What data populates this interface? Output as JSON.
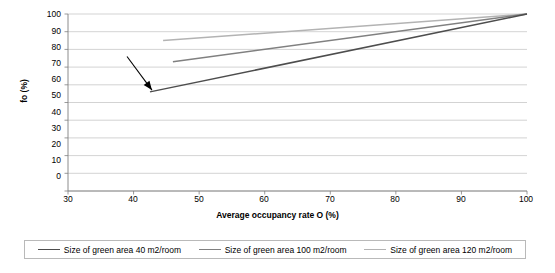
{
  "chart_data": {
    "type": "line",
    "title": "",
    "xlabel": "Average occupancy rate O (%)",
    "ylabel": "fo (%)",
    "xlim": [
      30,
      100
    ],
    "ylim": [
      0,
      100
    ],
    "xticks": [
      30,
      40,
      50,
      60,
      70,
      80,
      90,
      100
    ],
    "yticks": [
      0,
      10,
      20,
      30,
      40,
      50,
      60,
      70,
      80,
      90,
      100
    ],
    "grid": "horizontal",
    "legend_position": "bottom",
    "series": [
      {
        "name": "Size of green area 40 m2/room",
        "color": "#4d4d4d",
        "x": [
          42.5,
          100
        ],
        "values": [
          56,
          100
        ]
      },
      {
        "name": "Size of green area 100 m2/room",
        "color": "#808080",
        "x": [
          46,
          100
        ],
        "values": [
          73,
          100
        ]
      },
      {
        "name": "Size of green area 120 m2/room",
        "color": "#b3b3b3",
        "x": [
          44.5,
          100
        ],
        "values": [
          85,
          100
        ]
      }
    ],
    "annotations": [
      {
        "type": "arrow",
        "from_x": 39,
        "from_y": 76,
        "to_x": 42.8,
        "to_y": 57
      }
    ]
  },
  "legend": {
    "items": [
      {
        "label": "Size of green area 40 m2/room",
        "color": "#4d4d4d"
      },
      {
        "label": "Size of green area 100 m2/room",
        "color": "#808080"
      },
      {
        "label": "Size of green area 120 m2/room",
        "color": "#b3b3b3"
      }
    ]
  },
  "axes": {
    "y_tick_labels": [
      "100",
      "90",
      "80",
      "70",
      "60",
      "50",
      "40",
      "30",
      "20",
      "10",
      "0"
    ],
    "x_tick_labels": [
      "30",
      "40",
      "50",
      "60",
      "70",
      "80",
      "90",
      "100"
    ],
    "y_title": "fo (%)",
    "x_title": "Average occupancy rate O (%)"
  },
  "colors": {
    "grid": "#c8c8c8",
    "frame": "#808080",
    "annotation": "#000000"
  }
}
